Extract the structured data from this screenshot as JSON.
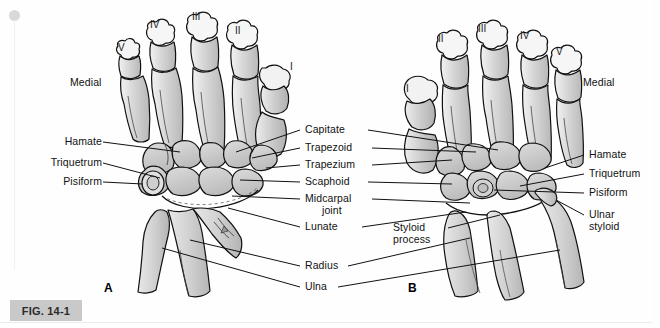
{
  "figure": {
    "tag": "FIG. 14-1",
    "panel_a_letter": "A",
    "panel_b_letter": "B",
    "artifact_dot": "scan-artifact-dot"
  },
  "colors": {
    "bone_fill_light": "#e2e2e2",
    "bone_fill_mid": "#cfcfcf",
    "bone_fill_dark": "#bdbdbd",
    "outline": "#111111",
    "fig_tag_bg": "#c9c9c9",
    "page_bg": "#fefefe"
  },
  "panel_a": {
    "orientation_label": "Medial",
    "digits": [
      "V",
      "IV",
      "III",
      "II",
      "I"
    ],
    "left_labels": [
      "Hamate",
      "Triquetrum",
      "Pisiform"
    ]
  },
  "panel_b": {
    "orientation_label": "Medial",
    "digits": [
      "I",
      "II",
      "III",
      "IV",
      "V"
    ],
    "right_labels": [
      "Hamate",
      "Triquetrum",
      "Pisiform",
      "Ulnar",
      "styloid"
    ],
    "styloid_process": [
      "Styloid",
      "process"
    ]
  },
  "center_labels": [
    "Capitate",
    "Trapezoid",
    "Trapezium",
    "Scaphoid",
    "Midcarpal",
    "joint",
    "Lunate",
    "Radius",
    "Ulna"
  ]
}
